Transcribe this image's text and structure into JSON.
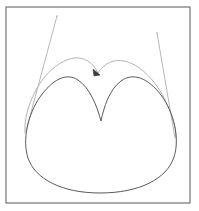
{
  "figure": {
    "title": "",
    "background_color": "#ffffff",
    "frame": {
      "label": "figure-border",
      "x": 6,
      "y": 7,
      "width": 184,
      "height": 196,
      "stroke_color": "#585858",
      "stroke_width": 1
    },
    "colors": {
      "main_curve": "#5a5a5a",
      "envelope_curve": "#b4b4b4",
      "construction_line": "#b8b8b8",
      "marker": "#3a3a3a",
      "frame": "#585858"
    },
    "curves": [
      {
        "name": "main-cardioid-curve",
        "description": "heart-shaped closed curve with cusp at top center",
        "stroke_color": "#5a5a5a",
        "stroke_width": 1,
        "cusp_point": [
          101,
          121
        ],
        "left_peak": [
          70,
          78
        ],
        "right_peak": [
          132,
          82
        ],
        "left_extreme": [
          25,
          132
        ],
        "right_extreme": [
          176,
          136
        ],
        "bottom_point": [
          100,
          193
        ],
        "path": "M 101 121 C 97 106 90 88 78 80 C 66 72 52 80 40 97 C 28 114 22 140 28 158 C 35 179 62 193 100 193 C 139 193 167 179 174 157 C 180 139 174 112 161 95 C 148 78 133 72 121 81 C 109 90 104 107 101 121 Z"
      },
      {
        "name": "envelope-arc-left",
        "description": "light gray outer arc over left lobe",
        "stroke_color": "#b4b4b4",
        "stroke_width": 1,
        "path": "M 98 73 C 93 62 84 57 74 58 C 60 60 45 73 36 90 C 28 105 24 120 25 133"
      },
      {
        "name": "envelope-arc-right",
        "description": "light gray outer arc over right lobe",
        "stroke_color": "#b4b4b4",
        "stroke_width": 1,
        "path": "M 98 73 C 104 63 114 59 124 61 C 139 64 154 79 163 96 C 172 113 176 127 176 137"
      },
      {
        "name": "construction-line-left",
        "description": "straight tangent line from upper left to curve",
        "stroke_color": "#b8b8b8",
        "stroke_width": 1,
        "start": [
          57,
          16
        ],
        "end": [
          26,
          131
        ]
      },
      {
        "name": "construction-line-right",
        "description": "straight tangent line from upper right to curve",
        "stroke_color": "#b8b8b8",
        "stroke_width": 1,
        "start": [
          157,
          33
        ],
        "end": [
          175,
          138
        ]
      }
    ],
    "markers": [
      {
        "name": "cusp-arrowhead-marker",
        "description": "small dark arrowhead at meeting point of envelope arcs",
        "x": 97,
        "y": 73,
        "color": "#3a3a3a",
        "size": 5
      },
      {
        "name": "endpoint-dot-left",
        "x": 57,
        "y": 16,
        "color": "#909090",
        "size": 1
      },
      {
        "name": "endpoint-dot-right",
        "x": 157,
        "y": 33,
        "color": "#909090",
        "size": 1
      }
    ],
    "labels": []
  }
}
